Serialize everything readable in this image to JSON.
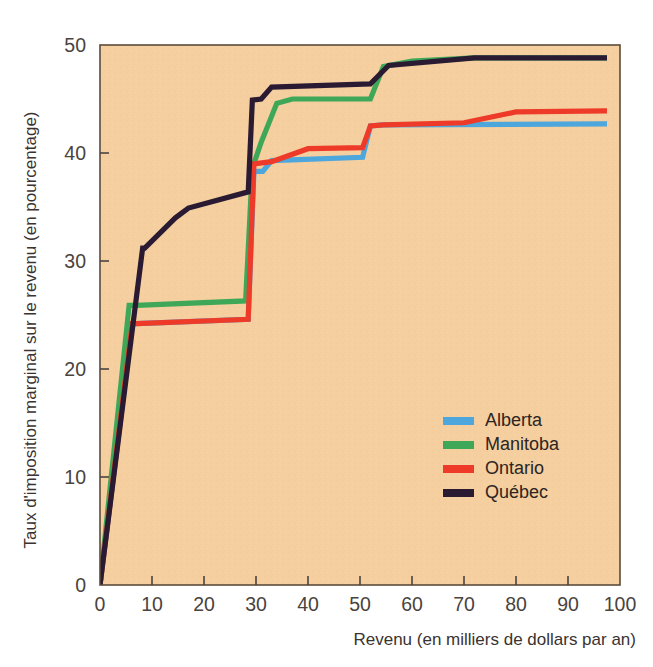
{
  "chart_data": {
    "type": "line",
    "title": "",
    "xlabel": "Revenu (en milliers de dollars par an)",
    "ylabel": "Taux d'imposition marginal sur le revenu (en pourcentage)",
    "xlim": [
      0,
      100
    ],
    "ylim": [
      0,
      50
    ],
    "xticks": [
      "0",
      "10",
      "20",
      "30",
      "40",
      "50",
      "60",
      "70",
      "80",
      "90",
      "100"
    ],
    "yticks": [
      "0",
      "10",
      "20",
      "30",
      "40",
      "50"
    ],
    "grid": false,
    "legend_position": "inside-lower-right",
    "plot_background": "#F5CFA0",
    "series": [
      {
        "name": "Alberta",
        "color": "#4DA6DC",
        "points": [
          [
            0,
            0
          ],
          [
            6.2,
            24.2
          ],
          [
            7.0,
            24.2
          ],
          [
            28.5,
            24.6
          ],
          [
            29.6,
            38.3
          ],
          [
            31.3,
            38.3
          ],
          [
            33.0,
            39.3
          ],
          [
            50.5,
            39.6
          ],
          [
            52.0,
            42.5
          ],
          [
            54.5,
            42.6
          ],
          [
            97.5,
            42.7
          ]
        ]
      },
      {
        "name": "Manitoba",
        "color": "#3FA858",
        "points": [
          [
            0,
            0
          ],
          [
            5.6,
            25.9
          ],
          [
            7.0,
            25.9
          ],
          [
            28.0,
            26.3
          ],
          [
            29.3,
            38.6
          ],
          [
            31.0,
            41.0
          ],
          [
            34.0,
            44.6
          ],
          [
            37.0,
            45.0
          ],
          [
            52.0,
            45.0
          ],
          [
            54.5,
            48.0
          ],
          [
            60.0,
            48.5
          ],
          [
            72.0,
            48.8
          ],
          [
            97.5,
            48.8
          ]
        ]
      },
      {
        "name": "Ontario",
        "color": "#EE3B29",
        "points": [
          [
            0,
            0
          ],
          [
            6.2,
            24.2
          ],
          [
            7.0,
            24.2
          ],
          [
            28.5,
            24.6
          ],
          [
            29.6,
            39.0
          ],
          [
            33.0,
            39.2
          ],
          [
            40.0,
            40.4
          ],
          [
            50.5,
            40.5
          ],
          [
            52.0,
            42.5
          ],
          [
            54.5,
            42.6
          ],
          [
            70.0,
            42.8
          ],
          [
            80.0,
            43.8
          ],
          [
            97.5,
            43.9
          ]
        ]
      },
      {
        "name": "Québec",
        "color": "#2A1B33",
        "points": [
          [
            0,
            0
          ],
          [
            8.2,
            31.2
          ],
          [
            8.6,
            31.2
          ],
          [
            14.5,
            34.0
          ],
          [
            17.0,
            34.9
          ],
          [
            28.5,
            36.4
          ],
          [
            29.3,
            44.9
          ],
          [
            31.0,
            45.0
          ],
          [
            33.0,
            46.1
          ],
          [
            52.0,
            46.4
          ],
          [
            55.5,
            48.1
          ],
          [
            72.0,
            48.8
          ],
          [
            97.5,
            48.8
          ]
        ]
      }
    ]
  },
  "axes": {
    "x_tick_labels": [
      "0",
      "10",
      "20",
      "30",
      "40",
      "50",
      "60",
      "70",
      "80",
      "90",
      "100"
    ],
    "y_tick_labels": [
      "0",
      "10",
      "20",
      "30",
      "40",
      "50"
    ],
    "x_axis_title": "Revenu (en milliers de dollars par an)",
    "y_axis_title": "Taux d'imposition marginal sur le revenu (en pourcentage)"
  },
  "legend": {
    "entries": [
      {
        "label": "Alberta",
        "color": "#4DA6DC"
      },
      {
        "label": "Manitoba",
        "color": "#3FA858"
      },
      {
        "label": "Ontario",
        "color": "#EE3B29"
      },
      {
        "label": "Québec",
        "color": "#2A1B33"
      }
    ]
  }
}
